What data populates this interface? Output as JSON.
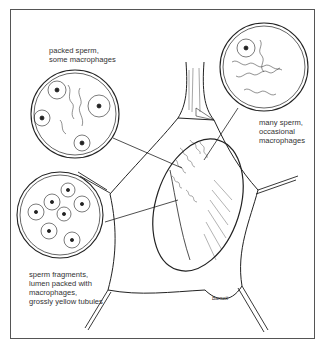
{
  "figure": {
    "callouts": [
      {
        "id": "top-left",
        "text": "packed sperm,\nsome macrophages"
      },
      {
        "id": "top-right",
        "text": "many sperm,\noccasional\nmacrophages"
      },
      {
        "id": "bottom-left",
        "text": "sperm fragments,\nlumen packed with\nmacrophages,\ngrossly yellow tubules"
      }
    ],
    "signature": "Barnett"
  }
}
